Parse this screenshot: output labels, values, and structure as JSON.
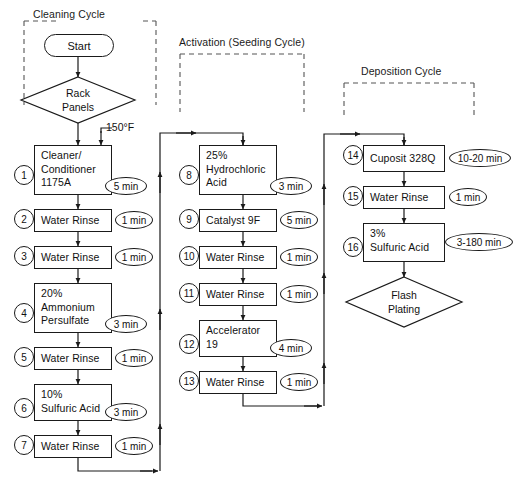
{
  "diagram": {
    "groups": [
      {
        "label": "Cleaning Cycle"
      },
      {
        "label": "Activation (Seeding Cycle)"
      },
      {
        "label": "Deposition Cycle"
      }
    ],
    "terminators": [
      {
        "label": "Start"
      }
    ],
    "decisions": [
      {
        "line1": "Rack",
        "line2": "Panels"
      },
      {
        "line1": "Flash",
        "line2": "Plating"
      }
    ],
    "annotations": [
      {
        "label": "150°F"
      }
    ],
    "steps": [
      {
        "num": "1",
        "lines": [
          "Cleaner/",
          "Conditioner",
          "1175A"
        ],
        "time": "5 min"
      },
      {
        "num": "2",
        "lines": [
          "Water Rinse"
        ],
        "time": "1 min"
      },
      {
        "num": "3",
        "lines": [
          "Water Rinse"
        ],
        "time": "1 min"
      },
      {
        "num": "4",
        "lines": [
          "20%",
          "Ammonium",
          "Persulfate"
        ],
        "time": "3 min"
      },
      {
        "num": "5",
        "lines": [
          "Water Rinse"
        ],
        "time": "1 min"
      },
      {
        "num": "6",
        "lines": [
          "10%",
          "Sulfuric Acid"
        ],
        "time": "3 min"
      },
      {
        "num": "7",
        "lines": [
          "Water Rinse"
        ],
        "time": "1 min"
      },
      {
        "num": "8",
        "lines": [
          "25%",
          "Hydrochloric",
          "Acid"
        ],
        "time": "3 min"
      },
      {
        "num": "9",
        "lines": [
          "Catalyst 9F"
        ],
        "time": "5 min"
      },
      {
        "num": "10",
        "lines": [
          "Water Rinse"
        ],
        "time": "1 min"
      },
      {
        "num": "11",
        "lines": [
          "Water Rinse"
        ],
        "time": "1 min"
      },
      {
        "num": "12",
        "lines": [
          "Accelerator",
          "19"
        ],
        "time": "4 min"
      },
      {
        "num": "13",
        "lines": [
          "Water Rinse"
        ],
        "time": "1 min"
      },
      {
        "num": "14",
        "lines": [
          "Cuposit 328Q"
        ],
        "time": "10-20 min"
      },
      {
        "num": "15",
        "lines": [
          "Water Rinse"
        ],
        "time": "1 min"
      },
      {
        "num": "16",
        "lines": [
          "3%",
          "Sulfuric Acid"
        ],
        "time": "3-180 min"
      }
    ],
    "colors": {
      "stroke": "#1a1a1a",
      "text": "#111111",
      "background": "#ffffff",
      "dashed": "#555555"
    }
  }
}
